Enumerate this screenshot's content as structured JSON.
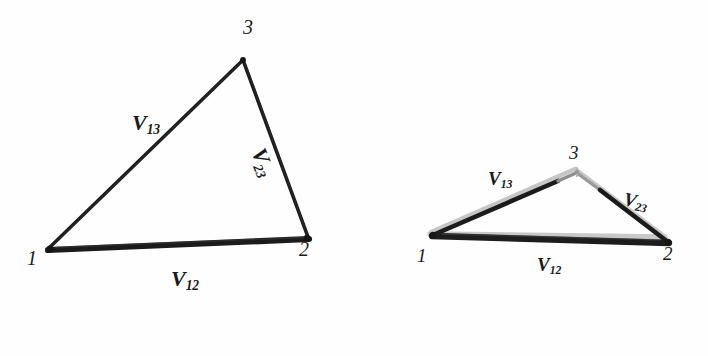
{
  "figure": {
    "background_color": "#fefefe",
    "ink_color": "#1a1a1a",
    "ghost_color": "#c9c9c9",
    "panels": [
      {
        "id": "left-panel",
        "name": "undeformed-triangle",
        "vertices": [
          {
            "label": "1",
            "x": 48,
            "y": 249
          },
          {
            "label": "2",
            "x": 308,
            "y": 238
          },
          {
            "label": "3",
            "x": 243,
            "y": 59
          }
        ],
        "vertex_labels": [
          {
            "text": "1",
            "x": 28,
            "y": 257,
            "size": 19
          },
          {
            "text": "2",
            "x": 300,
            "y": 245,
            "size": 19
          },
          {
            "text": "3",
            "x": 244,
            "y": 21,
            "size": 19
          }
        ],
        "edges": [
          {
            "from": "1",
            "to": "2",
            "name": "edge-v12",
            "stroke": "#1a1a1a",
            "width": 5
          },
          {
            "from": "1",
            "to": "3",
            "name": "edge-v13",
            "stroke": "#1a1a1a",
            "width": 3.6
          },
          {
            "from": "2",
            "to": "3",
            "name": "edge-v23",
            "stroke": "#1a1a1a",
            "width": 3.6
          }
        ],
        "edge_labels": [
          {
            "base": "V",
            "sub": "13",
            "x": 133,
            "y": 116,
            "size": 21,
            "rotate": 0
          },
          {
            "base": "V",
            "sub": "23",
            "x": 270,
            "y": 148,
            "size": 21,
            "rotate": 68
          },
          {
            "base": "V",
            "sub": "12",
            "x": 172,
            "y": 272,
            "size": 21,
            "rotate": 0
          }
        ]
      },
      {
        "id": "right-panel",
        "name": "deformed-triangle-overlay",
        "vertices": [
          {
            "label": "1",
            "x": 432,
            "y": 234
          },
          {
            "label": "2",
            "x": 668,
            "y": 243
          },
          {
            "label": "3",
            "x": 577,
            "y": 172
          }
        ],
        "ghost_vertices": [
          {
            "label": "1g",
            "x": 430,
            "y": 232
          },
          {
            "label": "2g",
            "x": 665,
            "y": 236
          },
          {
            "label": "3g",
            "x": 575,
            "y": 168
          }
        ],
        "vertex_labels": [
          {
            "text": "1",
            "x": 418,
            "y": 250,
            "size": 18
          },
          {
            "text": "2",
            "x": 662,
            "y": 247,
            "size": 18
          },
          {
            "text": "3",
            "x": 568,
            "y": 147,
            "size": 18
          }
        ],
        "edges": [
          {
            "from": "1",
            "to": "2",
            "name": "edge-v12",
            "stroke": "#1a1a1a",
            "width": 5
          },
          {
            "from": "1",
            "to": "3",
            "name": "edge-v13",
            "stroke": "#1a1a1a",
            "width": 4
          },
          {
            "from": "2",
            "to": "3",
            "name": "edge-v23",
            "stroke": "#1a1a1a",
            "width": 4
          }
        ],
        "edge_labels": [
          {
            "base": "V",
            "sub": "13",
            "x": 489,
            "y": 172,
            "size": 18,
            "rotate": 0
          },
          {
            "base": "V",
            "sub": "23",
            "x": 627,
            "y": 192,
            "size": 18,
            "rotate": 10
          },
          {
            "base": "V",
            "sub": "12",
            "x": 538,
            "y": 258,
            "size": 18,
            "rotate": 0
          }
        ]
      }
    ]
  }
}
